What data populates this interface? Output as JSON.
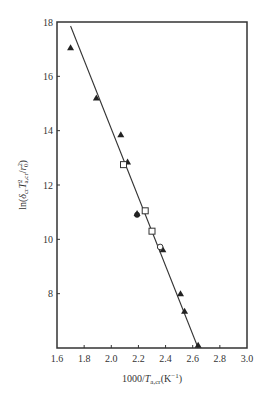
{
  "chart_data": {
    "type": "scatter",
    "title": "",
    "xlabel": "1000/T_a,cr (K^-1)",
    "ylabel": "ln(δ_cr T²_a,cr / r₀²)",
    "xlim": [
      1.6,
      3.0
    ],
    "ylim": [
      6,
      18
    ],
    "x_ticks": [
      1.6,
      1.8,
      2.0,
      2.2,
      2.4,
      2.6,
      2.8,
      3.0
    ],
    "x_tick_labels": [
      "1.6",
      "1.8",
      "2.0",
      "2.2",
      "2.4",
      "2.6",
      "2.8",
      "3.0"
    ],
    "y_ticks": [
      8,
      10,
      12,
      14,
      16,
      18
    ],
    "y_tick_labels": [
      "8",
      "10",
      "12",
      "14",
      "16",
      "18"
    ],
    "grid": false,
    "legend": "none",
    "series": [
      {
        "name": "filled-triangle",
        "marker": "triangle-filled",
        "x": [
          1.7,
          1.89,
          2.07,
          2.12,
          2.19,
          2.38,
          2.51,
          2.54,
          2.64
        ],
        "y": [
          17.05,
          15.2,
          13.85,
          12.85,
          10.95,
          9.62,
          8.0,
          7.35,
          6.1
        ]
      },
      {
        "name": "open-square",
        "marker": "square-open",
        "x": [
          2.09,
          2.25,
          2.3
        ],
        "y": [
          12.75,
          11.05,
          10.3
        ]
      },
      {
        "name": "filled-circle",
        "marker": "circle-filled",
        "x": [
          2.19
        ],
        "y": [
          10.9
        ]
      },
      {
        "name": "open-circle",
        "marker": "circle-open",
        "x": [
          2.36
        ],
        "y": [
          9.72
        ]
      }
    ],
    "fit_line": {
      "x": [
        1.7,
        2.64
      ],
      "y": [
        17.85,
        6.0
      ]
    }
  }
}
